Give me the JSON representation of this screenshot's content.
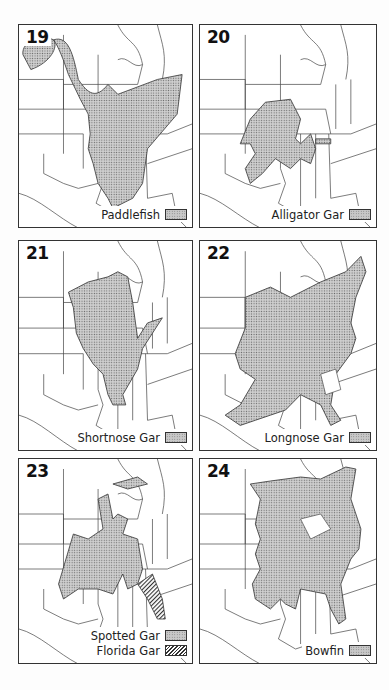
{
  "figure": {
    "fill_color": "#c8c8c8",
    "line_color": "#333333",
    "panels": [
      {
        "number": "19",
        "legend": [
          {
            "label": "Paddlefish",
            "pattern": "stippled"
          }
        ]
      },
      {
        "number": "20",
        "legend": [
          {
            "label": "Alligator Gar",
            "pattern": "stippled"
          }
        ]
      },
      {
        "number": "21",
        "legend": [
          {
            "label": "Shortnose Gar",
            "pattern": "stippled"
          }
        ]
      },
      {
        "number": "22",
        "legend": [
          {
            "label": "Longnose Gar",
            "pattern": "stippled"
          }
        ]
      },
      {
        "number": "23",
        "legend": [
          {
            "label": "Spotted Gar",
            "pattern": "stippled"
          },
          {
            "label": "Florida Gar",
            "pattern": "hatched"
          }
        ]
      },
      {
        "number": "24",
        "legend": [
          {
            "label": "Bowfin",
            "pattern": "stippled"
          }
        ]
      }
    ]
  }
}
